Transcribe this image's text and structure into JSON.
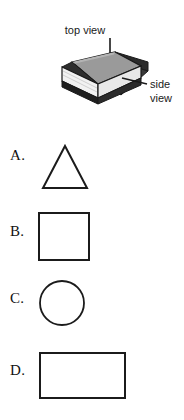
{
  "figure": {
    "object_name": "book",
    "top_view_label": "top view",
    "side_view_label_line1": "side",
    "side_view_label_line2": "view",
    "top_arrow_icon": "down-arrow-icon",
    "side_leader_icon": "leader-line-icon",
    "colors": {
      "top_face": "#9a9a9a",
      "top_face_edge": "#6e6e6e",
      "side_face_dark": "#2b2b2b",
      "pages_face": "#f2f2f2",
      "outline": "#1a1a1a",
      "background": "#ffffff"
    }
  },
  "options": [
    {
      "label": "A.",
      "shape": "triangle",
      "shape_name": "triangle-shape",
      "width": 48,
      "height": 45
    },
    {
      "label": "B.",
      "shape": "square",
      "shape_name": "square-shape",
      "width": 50,
      "height": 48
    },
    {
      "label": "C.",
      "shape": "circle",
      "shape_name": "circle-shape",
      "width": 46,
      "height": 45
    },
    {
      "label": "D.",
      "shape": "rectangle",
      "shape_name": "rectangle-shape",
      "width": 85,
      "height": 46
    }
  ]
}
